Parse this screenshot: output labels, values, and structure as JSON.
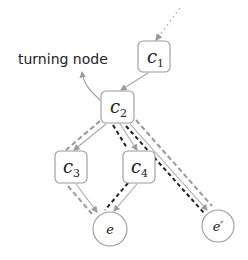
{
  "diagram": {
    "annotation": {
      "text": "turning node"
    },
    "nodes": [
      {
        "id": "c1",
        "label": "c",
        "sub": "1",
        "shape": "rounded-rect"
      },
      {
        "id": "c2",
        "label": "c",
        "sub": "2",
        "shape": "rounded-rect"
      },
      {
        "id": "c3",
        "label": "c",
        "sub": "3",
        "shape": "rounded-rect"
      },
      {
        "id": "c4",
        "label": "c",
        "sub": "4",
        "shape": "rounded-rect"
      },
      {
        "id": "e",
        "label": "e",
        "shape": "circle"
      },
      {
        "id": "e_prime",
        "label": "e′",
        "shape": "circle"
      }
    ],
    "edges": [
      {
        "from": "incoming",
        "to": "c1",
        "style": "dotted-gray"
      },
      {
        "from": "c1",
        "to": "c2",
        "style": "solid-gray"
      },
      {
        "from": "c2",
        "to": "c3",
        "style": "solid-gray"
      },
      {
        "from": "c2",
        "to": "c4",
        "style": "solid-gray"
      },
      {
        "from": "c2",
        "to": "e_prime",
        "style": "solid-gray"
      },
      {
        "from": "c3",
        "to": "e",
        "style": "solid-gray"
      },
      {
        "from": "c4",
        "to": "e",
        "style": "solid-gray"
      }
    ],
    "paths": [
      {
        "name": "gray-dashed-path-left",
        "route": [
          "c2",
          "c3",
          "e"
        ],
        "color": "#999999"
      },
      {
        "name": "black-dashed-path",
        "route": [
          "c2",
          "c4",
          "e"
        ],
        "color": "#222222"
      },
      {
        "name": "black-dashed-path-right",
        "route": [
          "c2",
          "e_prime"
        ],
        "color": "#222222"
      },
      {
        "name": "gray-dashed-path-right",
        "route": [
          "c2",
          "e_prime"
        ],
        "color": "#999999"
      }
    ],
    "colors": {
      "node_stroke": "#9a9a9a",
      "edge": "#a8a8a8",
      "dash_gray": "#9a9a9a",
      "dash_black": "#222222",
      "text": "#222222"
    }
  }
}
